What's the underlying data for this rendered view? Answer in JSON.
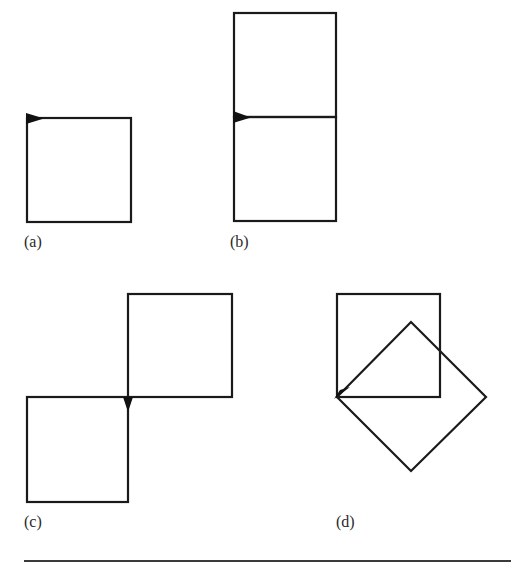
{
  "figure": {
    "stroke_color": "#1a1a1a",
    "panels": [
      {
        "id": "a",
        "label": "(a)",
        "description": "Single square with start marker at top-left corner",
        "shapes": [
          {
            "type": "square",
            "x": 27,
            "y": 118,
            "size": 104
          }
        ],
        "marker": {
          "type": "arrowhead-right",
          "x": 27,
          "y": 118
        }
      },
      {
        "id": "b",
        "label": "(b)",
        "description": "Two squares stacked vertically sharing an edge; marker at shared left vertex",
        "shapes": [
          {
            "type": "square",
            "x": 234,
            "y": 13,
            "size": 104
          },
          {
            "type": "square",
            "x": 234,
            "y": 117,
            "size": 104
          }
        ],
        "marker": {
          "type": "arrowhead-right",
          "x": 234,
          "y": 117
        }
      },
      {
        "id": "c",
        "label": "(c)",
        "description": "Two squares touching at one corner, diagonal arrangement; marker pointing down at shared vertex",
        "shapes": [
          {
            "type": "square",
            "x": 128,
            "y": 294,
            "size": 104
          },
          {
            "type": "square",
            "x": 27,
            "y": 397,
            "size": 104
          }
        ],
        "marker": {
          "type": "arrowhead-down",
          "x": 128,
          "y": 397
        }
      },
      {
        "id": "d",
        "label": "(d)",
        "description": "Square and a square rotated 45 degrees sharing the lower-left vertex",
        "shapes": [
          {
            "type": "square",
            "x": 336,
            "y": 294,
            "size": 104
          },
          {
            "type": "rotated-square",
            "points": "337,397 411,322 486,397 411,471"
          }
        ],
        "marker": {
          "type": "arrowhead-upright",
          "x": 337,
          "y": 397
        }
      }
    ]
  }
}
